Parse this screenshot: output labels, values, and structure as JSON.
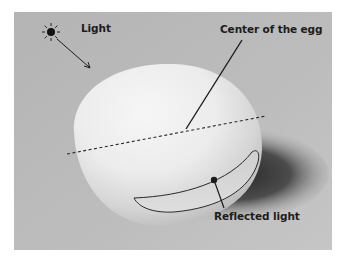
{
  "diagram": {
    "labels": {
      "light": "Light",
      "center": "Center of the egg",
      "reflected": "Reflected light"
    },
    "icons": {
      "light_source": "sun-icon",
      "light_direction": "arrow-icon"
    },
    "colors": {
      "background": "#b9b9b9",
      "egg_highlight": "#f4f4f4",
      "egg_shadow_side": "#c8c8c8",
      "cast_shadow": "#2a2a2a",
      "line": "#1c1c1c"
    }
  }
}
